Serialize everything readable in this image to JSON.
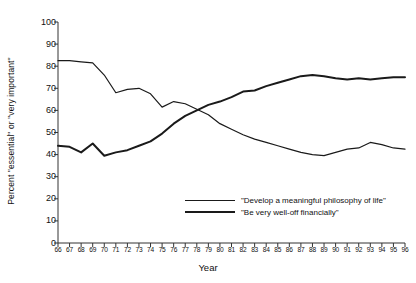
{
  "chart_data": {
    "type": "line",
    "title": "",
    "xlabel": "Year",
    "ylabel": "Percent \"essential\" or \"very important\"",
    "xlim": [
      66,
      96
    ],
    "ylim": [
      0,
      100
    ],
    "ytick_labels": [
      "0",
      "10",
      "20",
      "30",
      "40",
      "50",
      "60",
      "70",
      "80",
      "90",
      "100"
    ],
    "yticks": [
      0,
      10,
      20,
      30,
      40,
      50,
      60,
      70,
      80,
      90,
      100
    ],
    "grid": false,
    "legend_position": "inside-lower-right",
    "x": [
      66,
      67,
      68,
      69,
      70,
      71,
      72,
      73,
      74,
      75,
      76,
      77,
      78,
      79,
      80,
      81,
      82,
      83,
      84,
      85,
      86,
      87,
      88,
      89,
      90,
      91,
      92,
      93,
      94,
      95,
      96
    ],
    "xtick_labels": [
      "66",
      "67",
      "68",
      "69",
      "70",
      "71",
      "72",
      "73",
      "74",
      "75",
      "76",
      "77",
      "78",
      "79",
      "80",
      "81",
      "82",
      "83",
      "84",
      "85",
      "86",
      "87",
      "88",
      "89",
      "90",
      "91",
      "92",
      "93",
      "94",
      "95",
      "96"
    ],
    "series": [
      {
        "name": "\"Develop a meaningful philosophy of life\"",
        "style": "thin",
        "color": "#1a1a1a",
        "values": [
          82.5,
          82.5,
          82.0,
          81.5,
          76.0,
          68.0,
          69.5,
          70.0,
          67.5,
          61.5,
          64.0,
          63.0,
          60.5,
          58.0,
          54.0,
          51.5,
          49.0,
          47.0,
          45.5,
          44.0,
          42.5,
          41.0,
          40.0,
          39.5,
          41.0,
          42.5,
          43.0,
          45.5,
          44.5,
          43.0,
          42.5
        ]
      },
      {
        "name": "\"Be very well-off financially\"",
        "style": "thick",
        "color": "#1a1a1a",
        "values": [
          44.0,
          43.5,
          41.0,
          45.0,
          39.5,
          41.0,
          42.0,
          44.0,
          46.0,
          49.5,
          54.0,
          57.5,
          60.0,
          62.5,
          64.0,
          66.0,
          68.5,
          69.0,
          71.0,
          72.5,
          74.0,
          75.5,
          76.0,
          75.5,
          74.5,
          74.0,
          74.5,
          74.0,
          74.5,
          75.0,
          75.0
        ]
      }
    ]
  }
}
